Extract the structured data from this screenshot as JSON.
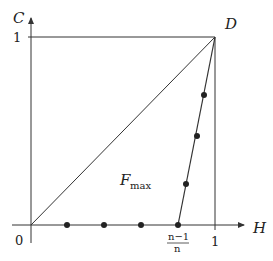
{
  "diagram": {
    "axes": {
      "y_label": "C",
      "x_label": "H",
      "origin_label": "0",
      "y_tick_label": "1",
      "x_tick_label": "1",
      "x_fraction_numerator": "n−1",
      "x_fraction_denominator": "n"
    },
    "point_labels": {
      "corner": "D"
    },
    "region_label": {
      "main": "F",
      "subscript": "max"
    },
    "colors": {
      "line": "#333333",
      "dot": "#222222",
      "background": "#ffffff"
    }
  }
}
